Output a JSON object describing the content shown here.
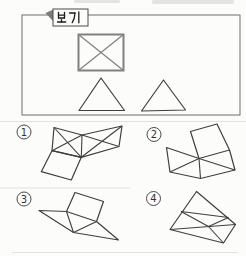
{
  "doc": {
    "kind": "scanned-geometry-worksheet",
    "example_label": "보기"
  },
  "colors": {
    "bg": "#fcfcfb",
    "ink": "#3f3f3f",
    "soft": "#808080",
    "frame": "#6f6f6f",
    "tab_border": "#4a4a4a",
    "flag": "#7a7a7a",
    "faint": "#e2e2e2",
    "smudge": "#cfcfcf",
    "digit": "#333333"
  },
  "scan_artifacts": {
    "smudges": [
      [
        74,
        0,
        46,
        3
      ],
      [
        152,
        0,
        82,
        4
      ]
    ],
    "faint_lines": [
      [
        0,
        121.5,
        246,
        121.5
      ],
      [
        0,
        188,
        130,
        188
      ],
      [
        12,
        252.5,
        238,
        252.5
      ]
    ]
  },
  "example_box": {
    "label": "보기",
    "frame": [
      22,
      15,
      218,
      100
    ],
    "tab": [
      53,
      9,
      35,
      17
    ],
    "flag": [
      [
        45.5,
        13
      ],
      [
        53.5,
        9.5
      ],
      [
        53.5,
        21.5
      ]
    ],
    "rect_x": {
      "rect": [
        78.5,
        34.5,
        45,
        36
      ],
      "diagonals": [
        [
          [
            78.5,
            34.5
          ],
          [
            123.5,
            70.5
          ]
        ],
        [
          [
            123.5,
            34.5
          ],
          [
            78.5,
            70.5
          ]
        ]
      ]
    },
    "triangles": [
      [
        [
          101,
          78
        ],
        [
          79,
          110.5
        ],
        [
          124.5,
          110.5
        ]
      ],
      [
        [
          163.5,
          80
        ],
        [
          141.5,
          111
        ],
        [
          185.5,
          110
        ]
      ]
    ]
  },
  "options": [
    {
      "digit": "1",
      "badge": [
        24,
        132
      ],
      "outline": [
        [
          54,
          127.5
        ],
        [
          82,
          135
        ],
        [
          122,
          126
        ],
        [
          119,
          146.5
        ],
        [
          81.3,
          157.3
        ],
        [
          52,
          150.7
        ]
      ],
      "inner": [
        [
          [
            82,
            135
          ],
          [
            81.3,
            157.3
          ]
        ],
        [
          [
            54,
            127.5
          ],
          [
            81.3,
            157.3
          ]
        ],
        [
          [
            52,
            150.7
          ],
          [
            82,
            135
          ]
        ],
        [
          [
            82,
            135
          ],
          [
            119,
            146.5
          ]
        ],
        [
          [
            122,
            126
          ],
          [
            81.3,
            157.3
          ]
        ]
      ],
      "extra_polys": [
        [
          [
            52,
            150.7
          ],
          [
            81.3,
            157.3
          ],
          [
            71.3,
            180
          ],
          [
            41.3,
            171.7
          ]
        ]
      ]
    },
    {
      "digit": "2",
      "badge": [
        154,
        134.5
      ],
      "outline": [
        [
          166.5,
          147.5
        ],
        [
          199,
          158.5
        ],
        [
          190.5,
          131.5
        ],
        [
          217,
          124
        ],
        [
          229.5,
          150
        ],
        [
          235,
          170
        ],
        [
          200.5,
          178.5
        ],
        [
          170,
          172
        ]
      ],
      "inner": [
        [
          [
            199,
            158.5
          ],
          [
            229.5,
            150
          ]
        ],
        [
          [
            199,
            158.5
          ],
          [
            170,
            172
          ]
        ],
        [
          [
            199,
            158.5
          ],
          [
            200.5,
            178.5
          ]
        ],
        [
          [
            199,
            158.5
          ],
          [
            235,
            170
          ]
        ]
      ],
      "extra_polys": []
    },
    {
      "digit": "3",
      "badge": [
        24,
        199
      ],
      "outline": [
        [
          39,
          210.5
        ],
        [
          66.5,
          211.5
        ],
        [
          75,
          192.5
        ],
        [
          103.5,
          201.5
        ],
        [
          96.5,
          221.5
        ],
        [
          118.5,
          240
        ],
        [
          73.5,
          232.5
        ]
      ],
      "inner": [
        [
          [
            66.5,
            211.5
          ],
          [
            96.5,
            221.5
          ]
        ],
        [
          [
            66.5,
            211.5
          ],
          [
            73.5,
            232.5
          ]
        ],
        [
          [
            73.5,
            232.5
          ],
          [
            96.5,
            221.5
          ]
        ]
      ],
      "extra_polys": []
    },
    {
      "digit": "4",
      "badge": [
        153.5,
        198.5
      ],
      "outline": [
        [
          196.5,
          191.5
        ],
        [
          235.5,
          224.5
        ],
        [
          223.5,
          243
        ],
        [
          170,
          229.5
        ]
      ],
      "inner": [
        [
          [
            170,
            229.5
          ],
          [
            235.5,
            224.5
          ]
        ],
        [
          [
            181,
            211.5
          ],
          [
            228.5,
            217.5
          ]
        ],
        [
          [
            181,
            211.5
          ],
          [
            208.5,
            226.5
          ]
        ],
        [
          [
            228.5,
            217.5
          ],
          [
            208.5,
            226.5
          ]
        ],
        [
          [
            208.5,
            226.5
          ],
          [
            223.5,
            243
          ]
        ]
      ],
      "extra_polys": []
    }
  ]
}
